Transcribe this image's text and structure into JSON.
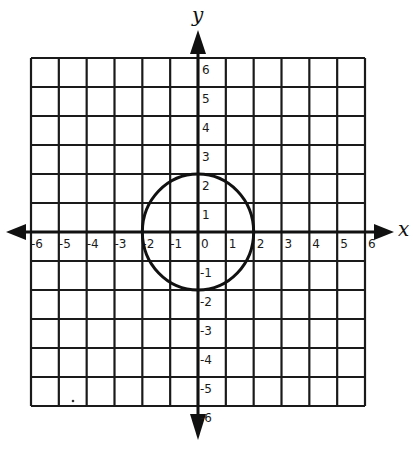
{
  "figure": {
    "title": "",
    "colors": {
      "background": "#ffffff",
      "ink": "#111111"
    }
  },
  "axes": {
    "x_label": "x",
    "y_label": "y",
    "x_range": [
      -6,
      6
    ],
    "y_range": [
      -6,
      6
    ],
    "x_ticks": [
      "-6",
      "-5",
      "-4",
      "-3",
      "-2",
      "-1",
      "0",
      "1",
      "2",
      "3",
      "4",
      "5",
      "6"
    ],
    "y_ticks": [
      "6",
      "5",
      "4",
      "3",
      "2",
      "1",
      "-1",
      "-2",
      "-3",
      "-4",
      "-5",
      "-6"
    ],
    "grid": true,
    "grid_step": 1
  },
  "shapes": [
    {
      "type": "circle",
      "center": [
        0,
        0
      ],
      "radius": 2,
      "equation": "x^2 + y^2 = 4"
    }
  ],
  "chart_data": {
    "type": "scatter",
    "title": "",
    "xlabel": "x",
    "ylabel": "y",
    "xlim": [
      -6,
      6
    ],
    "ylim": [
      -6,
      6
    ],
    "grid": true,
    "x_tick_labels": [
      "-6",
      "-5",
      "-4",
      "-3",
      "-2",
      "-1",
      "0",
      "1",
      "2",
      "3",
      "4",
      "5",
      "6"
    ],
    "y_tick_labels": [
      "-6",
      "-5",
      "-4",
      "-3",
      "-2",
      "-1",
      "1",
      "2",
      "3",
      "4",
      "5",
      "6"
    ],
    "series": [
      {
        "name": "circle x^2 + y^2 = 4",
        "shape": "circle",
        "center": [
          0,
          0
        ],
        "radius": 2,
        "key_points": [
          [
            2,
            0
          ],
          [
            0,
            2
          ],
          [
            -2,
            0
          ],
          [
            0,
            -2
          ]
        ]
      }
    ],
    "legend": null
  }
}
